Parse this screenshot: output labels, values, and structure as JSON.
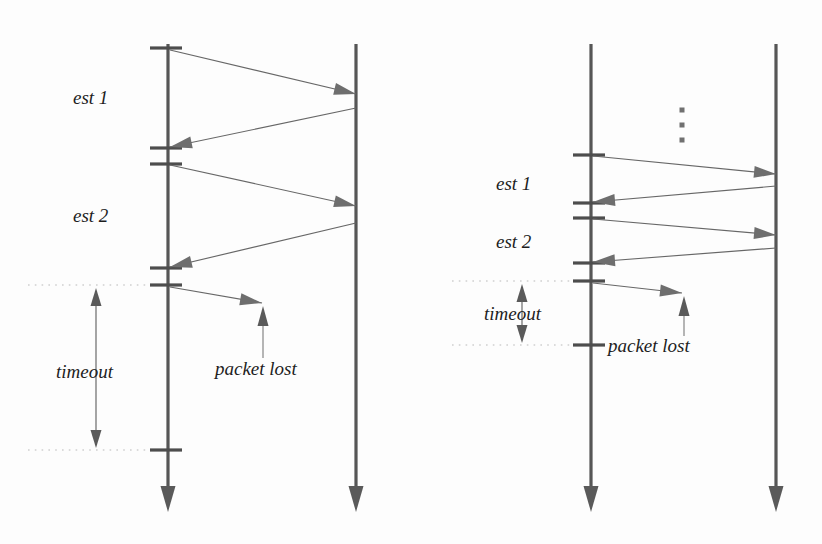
{
  "figure": {
    "title": "",
    "background": "#fdfdfd",
    "ink_color": "#565656",
    "message_color": "#676767",
    "guide_color": "#b9b9b9"
  },
  "labels": {
    "est1": "est 1",
    "est2": "est 2",
    "timeout": "timeout",
    "packet_lost": "packet lost",
    "ellipsis": "⋮"
  },
  "panels": [
    {
      "id": "left",
      "name": "left-diagram",
      "lifelines": [
        {
          "name": "client-lifeline",
          "x": 168,
          "y_top": 44,
          "y_bottom": 512
        },
        {
          "name": "server-lifeline",
          "x": 356,
          "y_top": 44,
          "y_bottom": 512
        }
      ],
      "ticks": [
        {
          "y": 48,
          "x_from": 150,
          "x_to": 182
        },
        {
          "y": 148,
          "x_from": 150,
          "x_to": 182
        },
        {
          "y": 164,
          "x_from": 150,
          "x_to": 182
        },
        {
          "y": 268,
          "x_from": 150,
          "x_to": 182
        },
        {
          "y": 285,
          "x_from": 150,
          "x_to": 182
        },
        {
          "y": 450,
          "x_from": 150,
          "x_to": 182
        }
      ],
      "messages": [
        {
          "name": "request-1",
          "dir": "right",
          "x1": 170,
          "y1": 50,
          "x2": 356,
          "y2": 94
        },
        {
          "name": "response-1",
          "dir": "left",
          "x1": 356,
          "y1": 108,
          "x2": 170,
          "y2": 147
        },
        {
          "name": "request-2",
          "dir": "right",
          "x1": 170,
          "y1": 165,
          "x2": 356,
          "y2": 206
        },
        {
          "name": "response-2",
          "dir": "left",
          "x1": 356,
          "y1": 223,
          "x2": 170,
          "y2": 267
        },
        {
          "name": "request-3-lost",
          "dir": "right",
          "x1": 170,
          "y1": 287,
          "x2": 262,
          "y2": 303
        }
      ],
      "annotations": [
        {
          "name": "est1-label",
          "text_key": "est1",
          "x": 73,
          "y": 104
        },
        {
          "name": "est2-label",
          "text_key": "est2",
          "x": 73,
          "y": 222
        },
        {
          "name": "timeout-label",
          "text_key": "timeout",
          "x": 56,
          "y": 378
        },
        {
          "name": "packet-lost-label",
          "text_key": "packet_lost",
          "x": 215,
          "y": 375
        }
      ],
      "guides": [
        {
          "name": "timeout-guide-top",
          "y": 285,
          "x_from": 28,
          "x_to": 165
        },
        {
          "name": "timeout-guide-bottom",
          "y": 450,
          "x_from": 28,
          "x_to": 165
        }
      ],
      "dimension": {
        "name": "timeout-dimension",
        "x": 96,
        "y_top": 288,
        "y_bottom": 448
      },
      "pointer": {
        "name": "packet-lost-pointer",
        "x": 263,
        "y_from": 358,
        "y_to": 306
      },
      "ellipsis": null
    },
    {
      "id": "right",
      "name": "right-diagram",
      "lifelines": [
        {
          "name": "client-lifeline",
          "x": 591,
          "y_top": 44,
          "y_bottom": 512
        },
        {
          "name": "server-lifeline",
          "x": 776,
          "y_top": 44,
          "y_bottom": 512
        }
      ],
      "ticks": [
        {
          "y": 155,
          "x_from": 573,
          "x_to": 605
        },
        {
          "y": 203,
          "x_from": 573,
          "x_to": 605
        },
        {
          "y": 218,
          "x_from": 573,
          "x_to": 605
        },
        {
          "y": 263,
          "x_from": 573,
          "x_to": 605
        },
        {
          "y": 281,
          "x_from": 573,
          "x_to": 605
        },
        {
          "y": 345,
          "x_from": 573,
          "x_to": 605
        }
      ],
      "messages": [
        {
          "name": "request-n",
          "dir": "right",
          "x1": 593,
          "y1": 156,
          "x2": 776,
          "y2": 174
        },
        {
          "name": "response-n",
          "dir": "left",
          "x1": 776,
          "y1": 186,
          "x2": 593,
          "y2": 202
        },
        {
          "name": "request-n1",
          "dir": "right",
          "x1": 593,
          "y1": 219,
          "x2": 776,
          "y2": 235
        },
        {
          "name": "response-n1",
          "dir": "left",
          "x1": 776,
          "y1": 248,
          "x2": 593,
          "y2": 262
        },
        {
          "name": "request-n2-lost",
          "dir": "right",
          "x1": 593,
          "y1": 283,
          "x2": 682,
          "y2": 293
        }
      ],
      "annotations": [
        {
          "name": "est1-label",
          "text_key": "est1",
          "x": 496,
          "y": 190
        },
        {
          "name": "est2-label",
          "text_key": "est2",
          "x": 496,
          "y": 248
        },
        {
          "name": "timeout-label",
          "text_key": "timeout",
          "x": 484,
          "y": 320
        },
        {
          "name": "packet-lost-label",
          "text_key": "packet_lost",
          "x": 608,
          "y": 352
        }
      ],
      "guides": [
        {
          "name": "timeout-guide-top",
          "y": 281,
          "x_from": 452,
          "x_to": 588
        },
        {
          "name": "timeout-guide-bottom",
          "y": 345,
          "x_from": 452,
          "x_to": 588
        }
      ],
      "dimension": {
        "name": "timeout-dimension",
        "x": 522,
        "y_top": 284,
        "y_bottom": 343
      },
      "pointer": {
        "name": "packet-lost-pointer",
        "x": 684,
        "y_from": 336,
        "y_to": 296
      },
      "ellipsis": {
        "name": "vertical-ellipsis",
        "x": 682,
        "ys": [
          110,
          125,
          140
        ],
        "size": 5
      }
    }
  ]
}
